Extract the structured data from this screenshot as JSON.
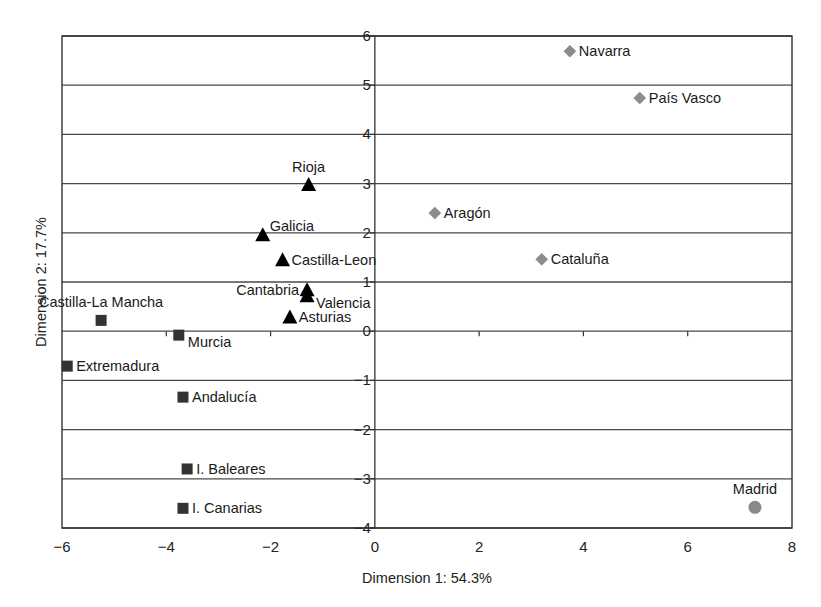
{
  "chart_data": {
    "type": "scatter",
    "title": "",
    "xlabel": "Dimension 1: 54.3%",
    "ylabel": "Dimension 2: 17.7%",
    "xlim": [
      -6,
      8
    ],
    "ylim": [
      -4,
      6
    ],
    "x_ticks": [
      -6,
      -4,
      -2,
      0,
      2,
      4,
      6,
      8
    ],
    "y_ticks": [
      6,
      5,
      4,
      3,
      2,
      1,
      0,
      -1,
      -2,
      -3,
      -4
    ],
    "x_tick_labels": [
      "−6",
      "−4",
      "−2",
      "0",
      "2",
      "4",
      "6",
      "8"
    ],
    "y_tick_labels": [
      "6",
      "5",
      "4",
      "3",
      "2",
      "1",
      "0",
      "−1",
      "−2",
      "−3",
      "−4"
    ],
    "grid": "horizontal",
    "legend": null,
    "series": [
      {
        "name": "group-diamond",
        "marker": "diamond",
        "color": "#8c8c8c",
        "points": [
          {
            "label": "Navarra",
            "x": 3.74,
            "y": 5.69,
            "label_pos": "right"
          },
          {
            "label": "País Vasco",
            "x": 5.08,
            "y": 4.74,
            "label_pos": "right"
          },
          {
            "label": "Aragón",
            "x": 1.15,
            "y": 2.4,
            "label_pos": "right"
          },
          {
            "label": "Cataluña",
            "x": 3.2,
            "y": 1.46,
            "label_pos": "right"
          }
        ]
      },
      {
        "name": "group-triangle",
        "marker": "triangle",
        "color": "#000000",
        "points": [
          {
            "label": "Rioja",
            "x": -1.27,
            "y": 2.97,
            "label_pos": "top"
          },
          {
            "label": "Galicia",
            "x": -2.15,
            "y": 1.95,
            "label_pos": "top-right"
          },
          {
            "label": "Castilla-Leon",
            "x": -1.77,
            "y": 1.44,
            "label_pos": "right"
          },
          {
            "label": "Cantabria",
            "x": -1.3,
            "y": 0.83,
            "label_pos": "left"
          },
          {
            "label": "Valencia",
            "x": -1.3,
            "y": 0.71,
            "label_pos": "bottom-right"
          },
          {
            "label": "Asturias",
            "x": -1.63,
            "y": 0.28,
            "label_pos": "right"
          }
        ]
      },
      {
        "name": "group-square",
        "marker": "square",
        "color": "#333333",
        "points": [
          {
            "label": "Castilla-La Mancha",
            "x": -5.25,
            "y": 0.22,
            "label_pos": "top"
          },
          {
            "label": "Murcia",
            "x": -3.76,
            "y": -0.08,
            "label_pos": "bottom-right"
          },
          {
            "label": "Extremadura",
            "x": -5.9,
            "y": -0.71,
            "label_pos": "right"
          },
          {
            "label": "Andalucía",
            "x": -3.68,
            "y": -1.34,
            "label_pos": "right"
          },
          {
            "label": "I. Baleares",
            "x": -3.6,
            "y": -2.8,
            "label_pos": "right"
          },
          {
            "label": "I. Canarias",
            "x": -3.68,
            "y": -3.6,
            "label_pos": "right"
          }
        ]
      },
      {
        "name": "group-circle",
        "marker": "circle",
        "color": "#8a8a8a",
        "points": [
          {
            "label": "Madrid",
            "x": 7.29,
            "y": -3.58,
            "label_pos": "top"
          }
        ]
      }
    ]
  },
  "layout": {
    "plot_left": 62,
    "plot_top": 36,
    "plot_right": 792,
    "plot_bottom": 528
  }
}
